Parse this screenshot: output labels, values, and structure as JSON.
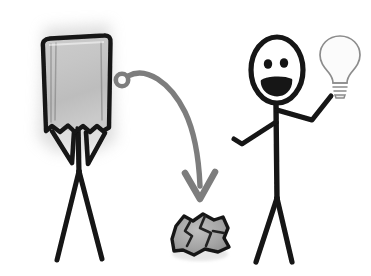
{
  "illustration": {
    "title": "Stick figure with paper bag on head beside smiling stick figure holding a light bulb",
    "background_color": "#ffffff",
    "ink_color": "#141414",
    "arrow_color": "#7d7d7d",
    "bag_fill_color": "#c2c2c2",
    "bag_shadow_color": "#d9d9d9",
    "paper_fill_color": "#a8a8a8",
    "bulb_outline_color": "#8c8c8c"
  },
  "figures": {
    "left": {
      "name": "bagged-figure",
      "description": "Stick figure whose head and torso are covered by a crumpled paper bag with a torn bottom edge",
      "head_covering": "paper-bag",
      "arms": 2,
      "legs": 2,
      "mood": "hidden"
    },
    "right": {
      "name": "idea-figure",
      "description": "Smiling stick figure with oval head, two dot eyes, open smiling mouth, left arm lowered with hooked hand, right arm raised holding a light bulb",
      "eyes": 2,
      "mouth": "open-smile",
      "holding": "light-bulb",
      "mood": "happy"
    }
  },
  "objects": {
    "paper_bag": {
      "label": "paper-bag",
      "bottom_edge": "torn"
    },
    "light_bulb": {
      "label": "light-bulb",
      "base": "screw-thread",
      "state": "idea"
    },
    "crumpled_paper": {
      "label": "crumpled-paper-ball"
    },
    "arrow": {
      "label": "curved-arrow",
      "start": "small-loop-near-bag",
      "end": "crumpled-paper-ball",
      "direction": "down-right"
    }
  }
}
